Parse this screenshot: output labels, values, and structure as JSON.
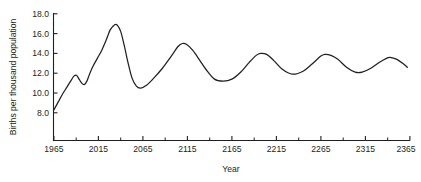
{
  "chart_data": {
    "type": "line",
    "title": "",
    "subtitle": "",
    "xlabel": "Year",
    "ylabel": "Births per thousand population",
    "xlim": [
      1965,
      2375
    ],
    "ylim": [
      7.0,
      18.0
    ],
    "grid": false,
    "legend": null,
    "legend_position": "none",
    "xticks": [
      1965,
      2015,
      2065,
      2115,
      2165,
      2215,
      2265,
      2315,
      2365
    ],
    "xtick_labels": [
      "1965",
      "2015",
      "2065",
      "2115",
      "2165",
      "2215",
      "2265",
      "2315",
      "2365"
    ],
    "x_minor_tick_interval": 25,
    "yticks": [
      8.0,
      10.0,
      12.0,
      14.0,
      16.0,
      18.0
    ],
    "ytick_labels": [
      "8.0",
      "10.0",
      "12.0",
      "14.0",
      "16.0",
      "18.0"
    ],
    "line_color": "#231f20",
    "series": [
      {
        "name": "Births per thousand population",
        "x": [
          1965,
          1970,
          1975,
          1980,
          1985,
          1988,
          1991,
          1994,
          1997,
          2000,
          2003,
          2006,
          2010,
          2015,
          2020,
          2025,
          2030,
          2035,
          2038,
          2042,
          2046,
          2050,
          2055,
          2060,
          2065,
          2072,
          2080,
          2090,
          2100,
          2108,
          2113,
          2118,
          2125,
          2133,
          2140,
          2150,
          2160,
          2170,
          2180,
          2190,
          2198,
          2203,
          2210,
          2218,
          2228,
          2240,
          2252,
          2262,
          2272,
          2277,
          2284,
          2292,
          2302,
          2312,
          2320,
          2330,
          2340,
          2348,
          2352,
          2360,
          2368,
          2372
        ],
        "y": [
          8.3,
          9.1,
          9.9,
          10.6,
          11.3,
          11.7,
          11.8,
          11.4,
          11.0,
          10.85,
          11.2,
          11.9,
          12.7,
          13.5,
          14.3,
          15.3,
          16.4,
          16.9,
          16.85,
          16.2,
          14.8,
          13.2,
          11.5,
          10.7,
          10.5,
          10.8,
          11.5,
          12.5,
          13.7,
          14.7,
          15.0,
          14.9,
          14.3,
          13.3,
          12.4,
          11.4,
          11.2,
          11.4,
          12.1,
          13.1,
          13.8,
          14.0,
          13.9,
          13.3,
          12.4,
          11.9,
          12.2,
          12.9,
          13.7,
          13.9,
          13.8,
          13.4,
          12.6,
          12.1,
          12.1,
          12.5,
          13.1,
          13.5,
          13.6,
          13.4,
          12.9,
          12.6
        ],
        "peaks": [
          {
            "x": 1991,
            "y": 11.8
          },
          {
            "x": 2036,
            "y": 16.9
          },
          {
            "x": 2113,
            "y": 15.0
          },
          {
            "x": 2203,
            "y": 14.0
          },
          {
            "x": 2277,
            "y": 13.9
          },
          {
            "x": 2352,
            "y": 13.6
          }
        ],
        "troughs": [
          {
            "x": 2000,
            "y": 10.85
          },
          {
            "x": 2062,
            "y": 10.5
          },
          {
            "x": 2156,
            "y": 11.2
          },
          {
            "x": 2241,
            "y": 11.9
          },
          {
            "x": 2318,
            "y": 12.1
          }
        ],
        "start_point": {
          "x": 1965,
          "y": 8.3
        },
        "end_point": {
          "x": 2372,
          "y": 12.6
        }
      }
    ]
  },
  "axes": {
    "x_title": "Year",
    "y_title": "Births per thousand population"
  }
}
